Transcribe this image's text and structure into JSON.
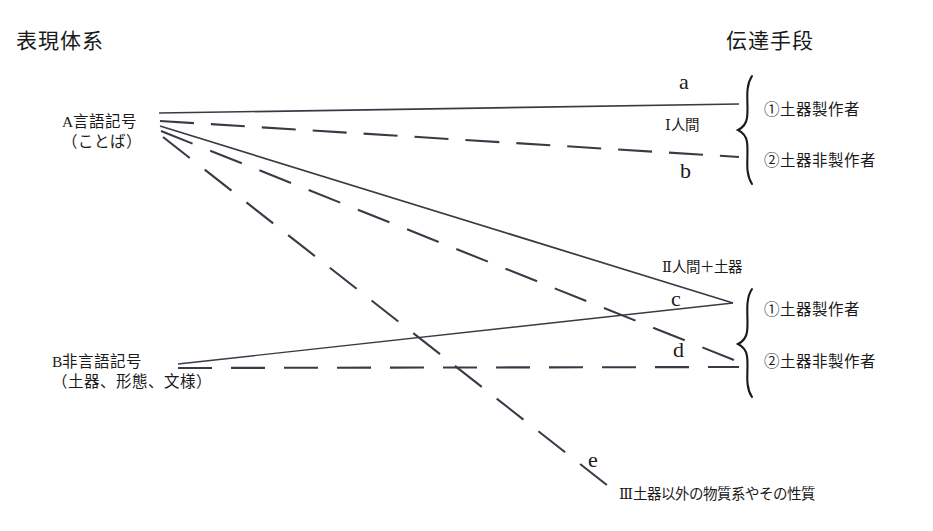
{
  "diagram": {
    "title_left": "表現体系",
    "title_right": "伝達手段",
    "nodes": [
      {
        "id": "A",
        "label_main": "A言語記号",
        "label_sub": "（ことば）"
      },
      {
        "id": "B",
        "label_main": "B非言語記号",
        "label_sub": "（土器、形態、文様）"
      }
    ],
    "edge_letters": {
      "a": "a",
      "b": "b",
      "c": "c",
      "d": "d",
      "e": "e"
    },
    "groups": [
      {
        "id": "I",
        "label": "Ⅰ人間",
        "items": [
          "①土器製作者",
          "②土器非製作者"
        ]
      },
      {
        "id": "II",
        "label": "Ⅱ人間＋土器",
        "items": [
          "①土器製作者",
          "②土器非製作者"
        ]
      },
      {
        "id": "III",
        "label": "Ⅲ土器以外の物質系やその性質",
        "items": []
      }
    ],
    "colors": {
      "ink": "#1a1a1a",
      "line": "#3a3a46",
      "background": "#ffffff"
    }
  }
}
